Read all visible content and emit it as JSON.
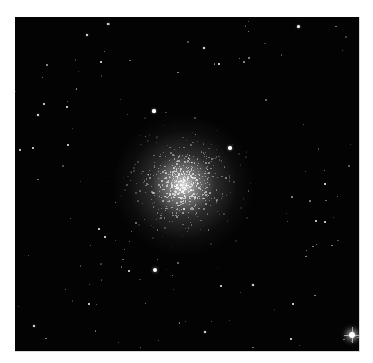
{
  "image": {
    "subject": "globular star cluster",
    "frame": {
      "x": 15,
      "y": 17,
      "width": 344,
      "height": 334,
      "background": "#030303",
      "page_background": "#ffffff"
    },
    "cluster": {
      "cx": 168,
      "cy": 168,
      "core_radius": 14,
      "halo_radius": 70,
      "faint_star_count": 520
    },
    "bright_stars": [
      {
        "x": 337,
        "y": 318,
        "r": 3.2,
        "spikes": true
      },
      {
        "x": 140,
        "y": 253,
        "r": 2.4
      },
      {
        "x": 215,
        "y": 131,
        "r": 1.8
      },
      {
        "x": 139,
        "y": 94,
        "r": 1.6
      },
      {
        "x": 283,
        "y": 9,
        "r": 1.5
      },
      {
        "x": 93,
        "y": 7,
        "r": 1.4
      },
      {
        "x": 72,
        "y": 18,
        "r": 1.3
      },
      {
        "x": 189,
        "y": 31,
        "r": 1.4
      },
      {
        "x": 204,
        "y": 47,
        "r": 1.2
      },
      {
        "x": 23,
        "y": 98,
        "r": 1.3
      },
      {
        "x": 53,
        "y": 128,
        "r": 1.2
      },
      {
        "x": 238,
        "y": 268,
        "r": 1.4
      },
      {
        "x": 190,
        "y": 315,
        "r": 1.4
      },
      {
        "x": 19,
        "y": 309,
        "r": 1.3
      },
      {
        "x": 74,
        "y": 287,
        "r": 1.1
      },
      {
        "x": 90,
        "y": 220,
        "r": 1.2
      },
      {
        "x": 84,
        "y": 212,
        "r": 1.1
      },
      {
        "x": 301,
        "y": 204,
        "r": 1.1
      },
      {
        "x": 310,
        "y": 167,
        "r": 1.1
      },
      {
        "x": 18,
        "y": 131,
        "r": 1.0
      },
      {
        "x": 5,
        "y": 133,
        "r": 1.0
      },
      {
        "x": 29,
        "y": 87,
        "r": 1.0
      },
      {
        "x": 114,
        "y": 254,
        "r": 1.1
      },
      {
        "x": 278,
        "y": 287,
        "r": 1.0
      },
      {
        "x": 276,
        "y": 322,
        "r": 1.1
      },
      {
        "x": 206,
        "y": 269,
        "r": 1.2
      },
      {
        "x": 310,
        "y": 205,
        "r": 1.0
      },
      {
        "x": 52,
        "y": 90,
        "r": 1.0
      },
      {
        "x": 86,
        "y": 45,
        "r": 1.0
      }
    ],
    "faint_field_star_count": 110
  }
}
